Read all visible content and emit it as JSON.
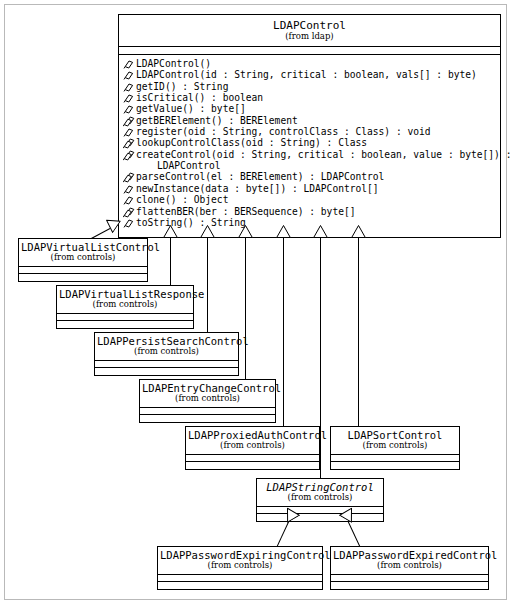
{
  "diagram": {
    "type": "uml-class-diagram",
    "root": {
      "name": "LDAPControl",
      "package": "(from ldap)",
      "abstract": false,
      "attributes": [],
      "operations": [
        {
          "icon": "public-method-icon",
          "text": "LDAPControl()"
        },
        {
          "icon": "public-method-icon",
          "text": "LDAPControl(id : String, critical : boolean, vals[] : byte)"
        },
        {
          "icon": "public-method-icon",
          "text": "getID() : String"
        },
        {
          "icon": "public-method-icon",
          "text": "isCritical() : boolean"
        },
        {
          "icon": "public-method-icon",
          "text": "getValue() : byte[]"
        },
        {
          "icon": "static-method-icon",
          "text": "getBERElement() : BERElement"
        },
        {
          "icon": "public-method-icon",
          "text": "register(oid : String, controlClass : Class) : void"
        },
        {
          "icon": "static-method-icon",
          "text": "lookupControlClass(oid : String) : Class"
        },
        {
          "icon": "static-method-icon",
          "text": "createControl(oid : String, critical : boolean, value : byte[]) :"
        },
        {
          "icon": "none",
          "text": "LDAPControl"
        },
        {
          "icon": "static-method-icon",
          "text": "parseControl(el : BERElement) : LDAPControl"
        },
        {
          "icon": "public-method-icon",
          "text": "newInstance(data : byte[]) : LDAPControl[]"
        },
        {
          "icon": "public-method-icon",
          "text": "clone() : Object"
        },
        {
          "icon": "static-method-icon",
          "text": "flattenBER(ber : BERSequence) : byte[]"
        },
        {
          "icon": "public-method-icon",
          "text": "toString() : String"
        }
      ]
    },
    "subclasses": [
      {
        "id": "vlc",
        "name": "LDAPVirtualListControl",
        "package": "(from controls)",
        "abstract": false
      },
      {
        "id": "vlr",
        "name": "LDAPVirtualListResponse",
        "package": "(from controls)",
        "abstract": false
      },
      {
        "id": "psc",
        "name": "LDAPPersistSearchControl",
        "package": "(from controls)",
        "abstract": false
      },
      {
        "id": "ecc",
        "name": "LDAPEntryChangeControl",
        "package": "(from controls)",
        "abstract": false
      },
      {
        "id": "pac",
        "name": "LDAPProxiedAuthControl",
        "package": "(from controls)",
        "abstract": false
      },
      {
        "id": "sc",
        "name": "LDAPSortControl",
        "package": "(from controls)",
        "abstract": false
      },
      {
        "id": "strc",
        "name": "LDAPStringControl",
        "package": "(from controls)",
        "abstract": true
      },
      {
        "id": "pwex",
        "name": "LDAPPasswordExpiringControl",
        "package": "(from controls)",
        "abstract": false
      },
      {
        "id": "pwed",
        "name": "LDAPPasswordExpiredControl",
        "package": "(from controls)",
        "abstract": false
      }
    ],
    "relationships": [
      {
        "kind": "generalization",
        "from": "LDAPVirtualListControl",
        "to": "LDAPControl"
      },
      {
        "kind": "generalization",
        "from": "LDAPVirtualListResponse",
        "to": "LDAPControl"
      },
      {
        "kind": "generalization",
        "from": "LDAPPersistSearchControl",
        "to": "LDAPControl"
      },
      {
        "kind": "generalization",
        "from": "LDAPEntryChangeControl",
        "to": "LDAPControl"
      },
      {
        "kind": "generalization",
        "from": "LDAPProxiedAuthControl",
        "to": "LDAPControl"
      },
      {
        "kind": "generalization",
        "from": "LDAPSortControl",
        "to": "LDAPControl"
      },
      {
        "kind": "generalization",
        "from": "LDAPStringControl",
        "to": "LDAPControl"
      },
      {
        "kind": "generalization",
        "from": "LDAPPasswordExpiringControl",
        "to": "LDAPStringControl"
      },
      {
        "kind": "generalization",
        "from": "LDAPPasswordExpiredControl",
        "to": "LDAPStringControl"
      }
    ],
    "colors": {
      "line": "#000000",
      "background": "#ffffff",
      "frame": "#b9b9b9"
    }
  }
}
